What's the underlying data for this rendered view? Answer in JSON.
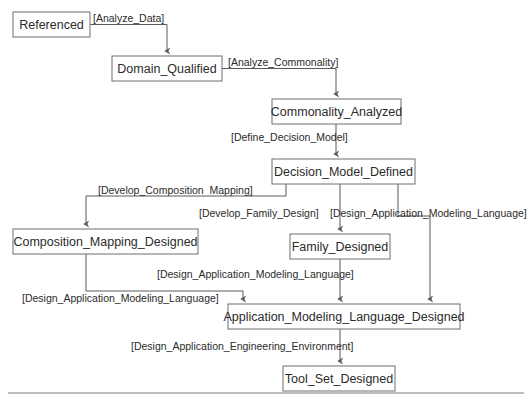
{
  "diagram": {
    "type": "state-transition-diagram",
    "colors": {
      "background": "#ffffff",
      "node_fill": "#ffffff",
      "node_stroke": "#6f6f6f",
      "edge_stroke": "#5a5a5a",
      "text": "#2b2b2b",
      "rule": "#7a7a7a"
    },
    "nodes": [
      {
        "id": "referenced",
        "label": "Referenced",
        "x": 13,
        "y": 12,
        "w": 77,
        "h": 25
      },
      {
        "id": "domain",
        "label": "Domain_Qualified",
        "x": 112,
        "y": 56,
        "h": 25,
        "w": 110
      },
      {
        "id": "commonality",
        "label": "Commonality_Analyzed",
        "x": 272,
        "y": 99,
        "w": 129,
        "h": 25
      },
      {
        "id": "decision",
        "label": "Decision_Model_Defined",
        "x": 272,
        "y": 159,
        "w": 143,
        "h": 25
      },
      {
        "id": "composition",
        "label": "Composition_Mapping_Designed",
        "x": 13,
        "y": 229,
        "w": 185,
        "h": 25
      },
      {
        "id": "family",
        "label": "Family_Designed",
        "x": 290,
        "y": 234,
        "w": 100,
        "h": 25
      },
      {
        "id": "amld",
        "label": "Application_Modeling_Language_Designed",
        "x": 228,
        "y": 304,
        "w": 232,
        "h": 25
      },
      {
        "id": "toolset",
        "label": "Tool_Set_Designed",
        "x": 283,
        "y": 366,
        "w": 112,
        "h": 25
      }
    ],
    "edges": [
      {
        "id": "e1",
        "from": "referenced",
        "to": "domain",
        "label": "[Analyze_Data]",
        "label_x": 93,
        "label_y": 14
      },
      {
        "id": "e2",
        "from": "domain",
        "to": "commonality",
        "label": "[Analyze_Commonality]",
        "label_x": 228,
        "label_y": 58
      },
      {
        "id": "e3",
        "from": "commonality",
        "to": "decision",
        "label": "[Define_Decision_Model]",
        "label_x": 231,
        "label_y": 133
      },
      {
        "id": "e4",
        "from": "decision",
        "to": "composition",
        "label": "[Develop_Composition  Mapping]",
        "label_x": 98,
        "label_y": 186
      },
      {
        "id": "e5",
        "from": "decision",
        "to": "family",
        "label": "[Develop_Family_Design]",
        "label_x": 199,
        "label_y": 209
      },
      {
        "id": "e6",
        "from": "decision",
        "to": "amld",
        "label": "[Design_Application_Modeling_Language]",
        "label_x": 330,
        "label_y": 209
      },
      {
        "id": "e7",
        "from": "family",
        "to": "amld",
        "label": "[Design_Application_Modeling_Language]",
        "label_x": 157,
        "label_y": 270
      },
      {
        "id": "e8",
        "from": "composition",
        "to": "amld",
        "label": "[Design_Application_Modeling_Language]",
        "label_x": 22,
        "label_y": 294
      },
      {
        "id": "e9",
        "from": "amld",
        "to": "toolset",
        "label": "[Design_Application_Engineering_Environment]",
        "label_x": 131,
        "label_y": 342
      }
    ],
    "baseline_rule": {
      "x1": 8,
      "y1": 393,
      "x2": 524,
      "y2": 393
    }
  }
}
